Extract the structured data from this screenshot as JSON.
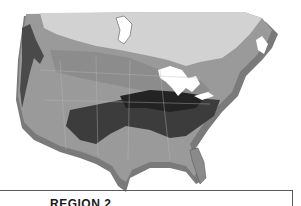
{
  "map": {
    "subject": "North America relief climate-zone map (grayscale)",
    "colors": {
      "canada_light": "#d4d4d4",
      "zone_mid": "#9a9a9a",
      "zone_dark": "#3c3c3c",
      "zone_darkest": "#1e1e1e",
      "lakes": "#ffffff",
      "relief_edge": "#7a7a7a"
    }
  },
  "label": {
    "region_title": "REGION 2"
  }
}
